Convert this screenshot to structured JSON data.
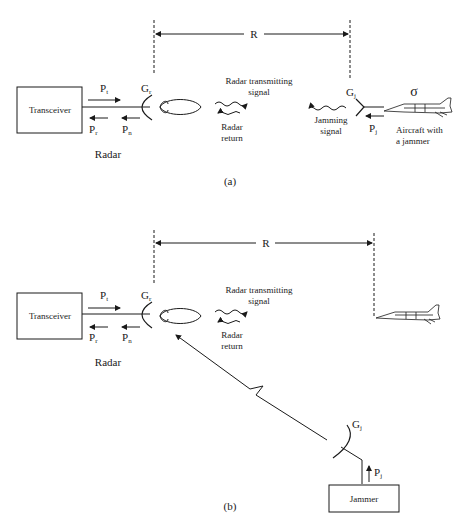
{
  "diagram_a": {
    "caption": "(a)",
    "range_label": "R",
    "transceiver_label": "Transceiver",
    "radar_label": "Radar",
    "pt": {
      "main": "P",
      "sub": "t"
    },
    "pr": {
      "main": "P",
      "sub": "r"
    },
    "pn": {
      "main": "P",
      "sub": "n"
    },
    "gr": {
      "main": "G",
      "sub": "r"
    },
    "gj": {
      "main": "G",
      "sub": "j"
    },
    "pj": {
      "main": "P",
      "sub": "j"
    },
    "sigma": "σ",
    "tx_signal": [
      "Radar transmitting",
      "signal"
    ],
    "return_signal": [
      "Radar",
      "return"
    ],
    "jamming_signal": [
      "Jamming",
      "signal"
    ],
    "aircraft_label": [
      "Aircraft with",
      "a jammer"
    ]
  },
  "diagram_b": {
    "caption": "(b)",
    "range_label": "R",
    "transceiver_label": "Transceiver",
    "radar_label": "Radar",
    "pt": {
      "main": "P",
      "sub": "t"
    },
    "pr": {
      "main": "P",
      "sub": "r"
    },
    "pn": {
      "main": "P",
      "sub": "n"
    },
    "gr": {
      "main": "G",
      "sub": "r"
    },
    "gj": {
      "main": "G",
      "sub": "j"
    },
    "pj": {
      "main": "P",
      "sub": "j"
    },
    "tx_signal": [
      "Radar transmitting",
      "signal"
    ],
    "return_signal": [
      "Radar",
      "return"
    ],
    "jammer_label": "Jammer"
  }
}
